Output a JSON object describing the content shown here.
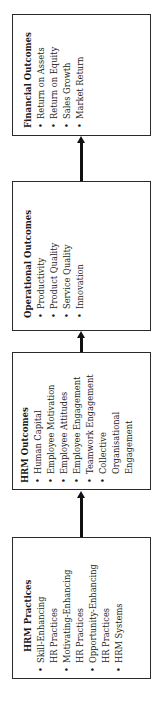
{
  "diagram": {
    "orientation": "rotated-90-ccw",
    "flow": "HRM Practices -> HRM Outcomes -> Operational Outcomes -> Financial Outcomes",
    "boxes": {
      "financial": {
        "title": "Financial Outcomes",
        "items": [
          "Return on Assets",
          "Return on Equity",
          "Sales Growth",
          "Market Return"
        ]
      },
      "operational": {
        "title": "Operational Outcomes",
        "items": [
          "Productivity",
          "Product Quality",
          "Service Quality",
          "Innovation"
        ]
      },
      "hrm_outcomes": {
        "title": "HRM Outcomes",
        "items": [
          "Human Capital",
          "Employee Motivation",
          "Employee Attitudes",
          "Employee Engagement",
          "Teamwork Engagement",
          "Collective",
          "Organisational",
          "Engagement"
        ]
      },
      "hrm_practices": {
        "title": "HRM Practices",
        "items": [
          "Skill-Enhancing",
          "HR Practices",
          "Motivating-Enhancing",
          "HR Practices",
          "Opportunity-Enhancing",
          "HR Practices",
          "HRM Systems"
        ]
      }
    },
    "arrows": [
      {
        "from": "HRM Practices",
        "to": "HRM Outcomes"
      },
      {
        "from": "HRM Outcomes",
        "to": "Operational Outcomes"
      },
      {
        "from": "Operational Outcomes",
        "to": "Financial Outcomes"
      }
    ],
    "colors": {
      "line": "#111111",
      "text": "#1a1a1a",
      "background": "#ffffff"
    }
  }
}
